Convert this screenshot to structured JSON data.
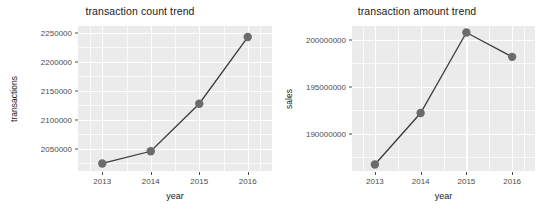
{
  "chart_data": [
    {
      "id": "transaction-count-trend",
      "type": "line",
      "title": "transaction count trend",
      "xlabel": "year",
      "ylabel": "transactions",
      "categories": [
        "2013",
        "2014",
        "2015",
        "2016"
      ],
      "x": [
        2013,
        2014,
        2015,
        2016
      ],
      "values": [
        2025000,
        2046000,
        2128000,
        2243000
      ],
      "ytick_labels": [
        "2050000",
        "2100000",
        "2150000",
        "2200000",
        "2250000"
      ],
      "ytick_values": [
        2050000,
        2100000,
        2150000,
        2200000,
        2250000
      ],
      "xtick_labels": [
        "2013",
        "2014",
        "2015",
        "2016"
      ],
      "ylim": [
        2012000,
        2262000
      ],
      "xlim": [
        2012.5,
        2016.5
      ],
      "grid": true,
      "legend": "none",
      "point_color": "#6b6b6b",
      "line_color": "#3b3b3b",
      "panel_color": "#ebebeb",
      "grid_color": "#ffffff"
    },
    {
      "id": "transaction-amount-trend",
      "type": "line",
      "title": "transaction amount trend",
      "xlabel": "year",
      "ylabel": "sales",
      "categories": [
        "2013",
        "2014",
        "2015",
        "2016"
      ],
      "x": [
        2013,
        2014,
        2015,
        2016
      ],
      "values": [
        186700000,
        192200000,
        200800000,
        198200000
      ],
      "ytick_labels": [
        "190000000",
        "195000000",
        "200000000"
      ],
      "ytick_values": [
        190000000,
        195000000,
        200000000
      ],
      "xtick_labels": [
        "2013",
        "2014",
        "2015",
        "2016"
      ],
      "ylim": [
        186000000,
        201500000
      ],
      "xlim": [
        2012.5,
        2016.5
      ],
      "grid": true,
      "legend": "none",
      "point_color": "#6b6b6b",
      "line_color": "#3b3b3b",
      "panel_color": "#ebebeb",
      "grid_color": "#ffffff"
    }
  ]
}
